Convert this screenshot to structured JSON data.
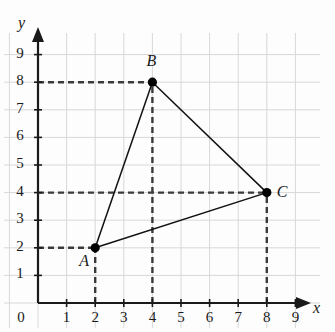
{
  "figure": {
    "background_color": "#fdfdfd",
    "grid_color": "#d8d8d8",
    "axis_color": "#1a1a1a",
    "dash_color": "#3a3a3a",
    "edge_color": "#111111"
  },
  "axes": {
    "x_label": "x",
    "y_label": "y",
    "origin_label": "0",
    "x_ticks": [
      "1",
      "2",
      "3",
      "4",
      "5",
      "6",
      "7",
      "8",
      "9"
    ],
    "y_ticks": [
      "1",
      "2",
      "3",
      "4",
      "5",
      "6",
      "7",
      "8",
      "9"
    ],
    "x_range": [
      0,
      9
    ],
    "y_range": [
      0,
      9
    ],
    "grid": true,
    "x_arrow": true,
    "y_arrow": true
  },
  "chart_data": {
    "type": "scatter",
    "xlabel": "x",
    "ylabel": "y",
    "xlim": [
      0,
      9
    ],
    "ylim": [
      0,
      9
    ],
    "grid": true,
    "legend": "none",
    "points": [
      {
        "label": "A",
        "x": 2,
        "y": 2,
        "label_dx": -16,
        "label_dy": 12
      },
      {
        "label": "B",
        "x": 4,
        "y": 8,
        "label_dx": -6,
        "label_dy": -22
      },
      {
        "label": "C",
        "x": 8,
        "y": 4,
        "label_dx": 10,
        "label_dy": -2
      }
    ],
    "edges": [
      {
        "from": "A",
        "to": "B"
      },
      {
        "from": "B",
        "to": "C"
      },
      {
        "from": "C",
        "to": "A"
      }
    ],
    "guides": [
      {
        "point": "A",
        "type": "horizontal",
        "from_x": 0,
        "to_x": 2,
        "y": 2
      },
      {
        "point": "A",
        "type": "vertical",
        "x": 2,
        "from_y": 0,
        "to_y": 2
      },
      {
        "point": "B",
        "type": "horizontal",
        "from_x": 0,
        "to_x": 4,
        "y": 8
      },
      {
        "point": "B",
        "type": "vertical",
        "x": 4,
        "from_y": 0,
        "to_y": 8
      },
      {
        "point": "C",
        "type": "horizontal",
        "from_x": 0,
        "to_x": 8,
        "y": 4
      },
      {
        "point": "C",
        "type": "vertical",
        "x": 8,
        "from_y": 0,
        "to_y": 4
      }
    ]
  }
}
